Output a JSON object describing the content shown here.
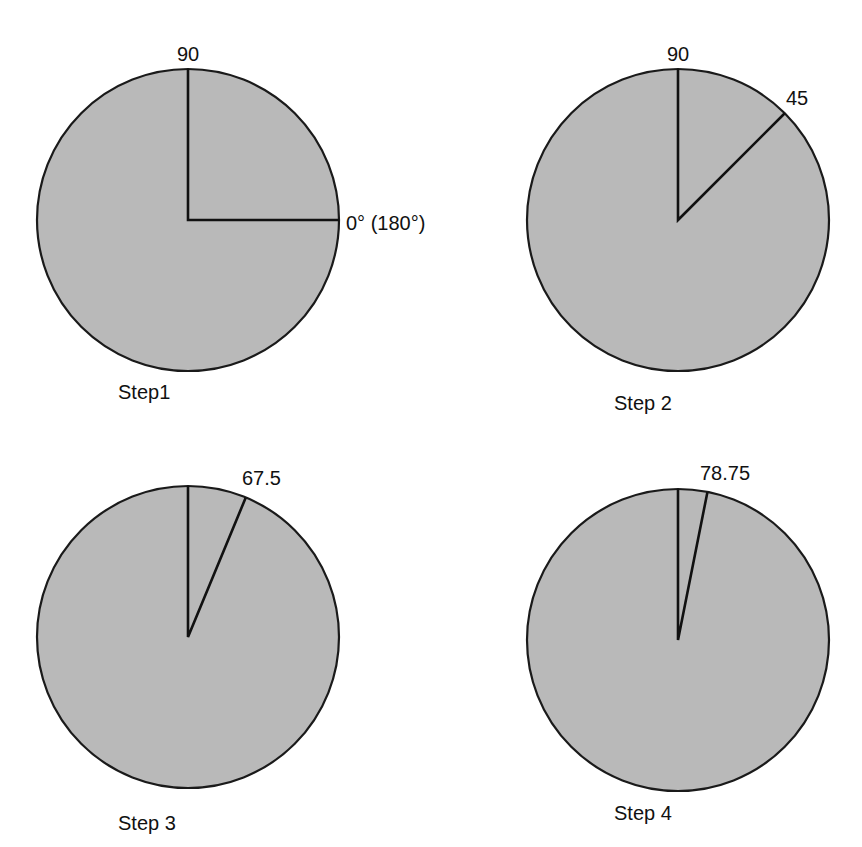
{
  "panels": [
    {
      "id": "step1",
      "caption": "Step1",
      "center": [
        188,
        220
      ],
      "radius": 151,
      "rays_deg": [
        90,
        0
      ],
      "labels": [
        {
          "text": "90",
          "x": 188,
          "y": 61,
          "anchor": "middle"
        },
        {
          "text": "0° (180°)",
          "x": 346,
          "y": 230,
          "anchor": "start"
        }
      ],
      "caption_pos": [
        118,
        399
      ]
    },
    {
      "id": "step2",
      "caption": "Step 2",
      "center": [
        678,
        220
      ],
      "radius": 151,
      "rays_deg": [
        90,
        45
      ],
      "labels": [
        {
          "text": "90",
          "x": 678,
          "y": 61,
          "anchor": "middle"
        },
        {
          "text": "45",
          "x": 786,
          "y": 105,
          "anchor": "start"
        }
      ],
      "caption_pos": [
        614,
        410
      ]
    },
    {
      "id": "step3",
      "caption": "Step 3",
      "center": [
        188,
        637
      ],
      "radius": 151,
      "rays_deg": [
        90,
        67.5
      ],
      "labels": [
        {
          "text": "67.5",
          "x": 242,
          "y": 485,
          "anchor": "start"
        }
      ],
      "caption_pos": [
        118,
        830
      ]
    },
    {
      "id": "step4",
      "caption": "Step 4",
      "center": [
        678,
        640
      ],
      "radius": 151,
      "rays_deg": [
        90,
        78.75
      ],
      "labels": [
        {
          "text": "78.75",
          "x": 700,
          "y": 480,
          "anchor": "start"
        }
      ],
      "caption_pos": [
        614,
        820
      ]
    }
  ],
  "colors": {
    "fill": "#b9b9b9",
    "stroke": "#111111",
    "background": "#ffffff"
  }
}
